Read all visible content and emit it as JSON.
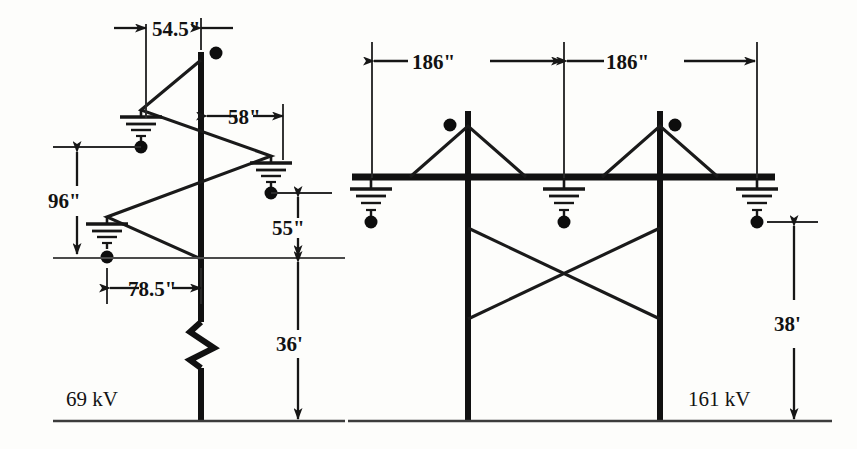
{
  "figure": {
    "background_color": "#fdfdfb",
    "line_color": "#111111"
  },
  "left_diagram": {
    "name": "69 kV single-pole tower",
    "voltage_label": "69 kV",
    "dimensions": [
      {
        "id": "d1",
        "label": "54.5\"",
        "orientation": "horizontal",
        "meaning": "offset from pole to left arm tip"
      },
      {
        "id": "d2",
        "label": "58\"",
        "orientation": "horizontal",
        "meaning": "offset from pole to right arm tip"
      },
      {
        "id": "d3",
        "label": "96\"",
        "orientation": "vertical",
        "meaning": "vertical span between upper and lower conductors"
      },
      {
        "id": "d4",
        "label": "78.5\"",
        "orientation": "horizontal",
        "meaning": "offset from pole to lower left conductor"
      },
      {
        "id": "d5",
        "label": "55\"",
        "orientation": "vertical",
        "meaning": "drop from conductor to reference line"
      },
      {
        "id": "d6",
        "label": "36'",
        "orientation": "vertical",
        "meaning": "height of reference line above ground"
      }
    ]
  },
  "right_diagram": {
    "name": "161 kV H-frame tower",
    "voltage_label": "161 kV",
    "dimensions": [
      {
        "id": "d7",
        "label": "186\"",
        "orientation": "horizontal",
        "meaning": "left bay width"
      },
      {
        "id": "d8",
        "label": "186\"",
        "orientation": "horizontal",
        "meaning": "right bay width"
      },
      {
        "id": "d9",
        "label": "38'",
        "orientation": "vertical",
        "meaning": "crossarm height above ground"
      }
    ]
  },
  "legend": {
    "insulator_dot": "conductor-position-dot",
    "ground_symbol": "earth-ground-symbol",
    "break_symbol": "pole-break-symbol"
  }
}
